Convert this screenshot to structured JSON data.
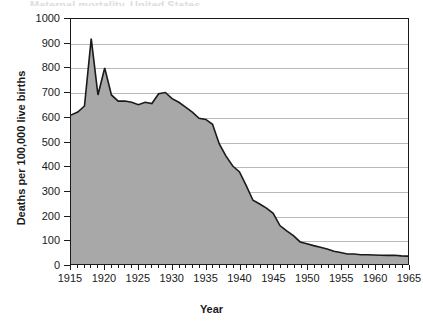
{
  "figure": {
    "title_remnant": "Maternal mortality, United States",
    "axis_titles": {
      "x": "Year",
      "y": "Deaths per 100,000 live births"
    }
  },
  "chart_data": {
    "type": "area",
    "title": "",
    "xlabel": "Year",
    "ylabel": "Deaths per 100,000 live births",
    "xlim": [
      1915,
      1965
    ],
    "ylim": [
      0,
      1000
    ],
    "xticks": [
      1915,
      1920,
      1925,
      1930,
      1935,
      1940,
      1945,
      1950,
      1955,
      1960,
      1965
    ],
    "yticks": [
      0,
      100,
      200,
      300,
      400,
      500,
      600,
      700,
      800,
      900,
      1000
    ],
    "x_minor_tick_step": 1,
    "grid": "horizontal",
    "legend": "none",
    "fill_color": "#a8a8a8",
    "line_color": "#1a1a1a",
    "x": [
      1915,
      1916,
      1917,
      1918,
      1919,
      1920,
      1921,
      1922,
      1923,
      1924,
      1925,
      1926,
      1927,
      1928,
      1929,
      1930,
      1931,
      1932,
      1933,
      1934,
      1935,
      1936,
      1937,
      1938,
      1939,
      1940,
      1941,
      1942,
      1943,
      1944,
      1945,
      1946,
      1947,
      1948,
      1949,
      1950,
      1951,
      1952,
      1953,
      1954,
      1955,
      1956,
      1957,
      1958,
      1959,
      1960,
      1961,
      1962,
      1963,
      1964,
      1965
    ],
    "values": [
      608,
      620,
      645,
      920,
      690,
      800,
      690,
      665,
      665,
      660,
      650,
      660,
      655,
      695,
      700,
      675,
      660,
      640,
      620,
      595,
      590,
      570,
      490,
      440,
      400,
      376,
      320,
      260,
      245,
      228,
      207,
      157,
      135,
      116,
      90,
      83,
      75,
      68,
      61,
      52,
      47,
      41,
      41,
      38,
      38,
      37,
      36,
      35,
      36,
      33,
      32
    ],
    "annotations": [
      {
        "year": 1918,
        "value": 920,
        "note": "influenza pandemic spike"
      },
      {
        "year": 1920,
        "value": 800,
        "note": "secondary peak"
      }
    ]
  }
}
